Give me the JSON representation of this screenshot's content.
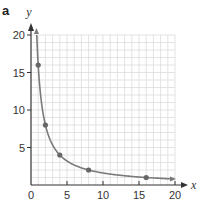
{
  "panel_label": "a",
  "chart_data": {
    "type": "line",
    "title": "",
    "xlabel": "x",
    "ylabel": "y",
    "xlim": [
      0,
      20
    ],
    "ylim": [
      0,
      20
    ],
    "grid": true,
    "grid_step": 1,
    "x_ticks": [
      0,
      5,
      10,
      15,
      20
    ],
    "y_ticks": [
      5,
      10,
      15,
      20
    ],
    "x_tick_labels": [
      "0",
      "5",
      "10",
      "15",
      "20"
    ],
    "y_tick_labels": [
      "5",
      "10",
      "15",
      "20"
    ],
    "function": "y = 16/x",
    "series": [
      {
        "name": "y = 16/x",
        "type": "curve",
        "x_range": [
          0.8,
          20
        ]
      },
      {
        "name": "points",
        "type": "scatter",
        "x": [
          1,
          2,
          4,
          8,
          16
        ],
        "y": [
          16,
          8,
          4,
          2,
          1
        ]
      }
    ],
    "legend": null
  },
  "colors": {
    "axis": "#333333",
    "grid": "#dcdcdc",
    "curve": "#7a7a7a",
    "points": "#666666"
  }
}
